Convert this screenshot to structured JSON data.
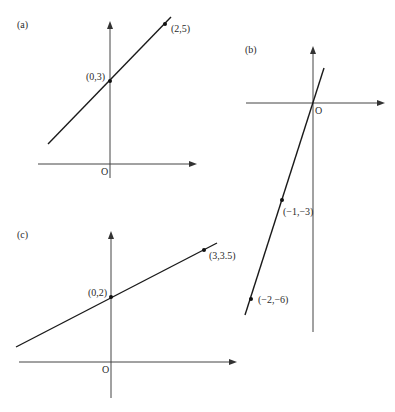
{
  "figure": {
    "colors": {
      "axis": "#444444",
      "line": "#1a1a1a",
      "text": "#2a2a2a",
      "background": "#ffffff"
    },
    "panels": [
      {
        "id": "a",
        "label": "(a)",
        "origin_label": "O",
        "points": [
          {
            "label": "(0,3)",
            "x": 0,
            "y": 3
          },
          {
            "label": "(2,5)",
            "x": 2,
            "y": 5
          }
        ],
        "equation": "y = x + 3"
      },
      {
        "id": "b",
        "label": "(b)",
        "origin_label": "O",
        "points": [
          {
            "label": "(−1,−3)",
            "x": -1,
            "y": -3
          },
          {
            "label": "(−2,−6)",
            "x": -2,
            "y": -6
          }
        ],
        "equation": "y = 3x"
      },
      {
        "id": "c",
        "label": "(c)",
        "origin_label": "O",
        "points": [
          {
            "label": "(0,2)",
            "x": 0,
            "y": 2
          },
          {
            "label": "(3,3.5)",
            "x": 3,
            "y": 3.5
          }
        ],
        "equation": "y = 0.5x + 2"
      }
    ]
  }
}
